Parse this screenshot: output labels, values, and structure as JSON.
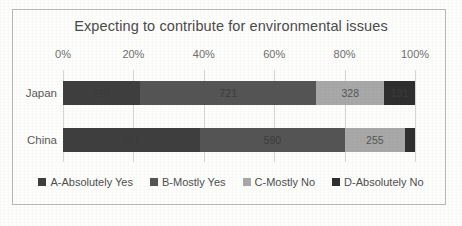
{
  "chart_data": {
    "type": "bar",
    "subtype": "stacked-horizontal-100pct",
    "title": "Expecting to contribute for environmental issues",
    "xlabel": "",
    "ylabel": "",
    "xlim": [
      0,
      100
    ],
    "grid": true,
    "legend_position": "bottom",
    "tick_labels": [
      "0%",
      "20%",
      "40%",
      "60%",
      "80%",
      "100%"
    ],
    "tick_values": [
      0,
      20,
      40,
      60,
      80,
      100
    ],
    "categories": [
      "Japan",
      "China"
    ],
    "series": [
      {
        "name": "A-Absolutely Yes",
        "color": "#3f3f3f",
        "values": [
          220,
          681
        ]
      },
      {
        "name": "B-Mostly Yes",
        "color": "#555555",
        "values": [
          721,
          590
        ]
      },
      {
        "name": "C-Mostly No",
        "color": "#a8a8a8",
        "values": [
          328,
          255
        ]
      },
      {
        "name": "D-Absolutely No",
        "color": "#2f2f2f",
        "values": [
          131,
          29
        ]
      }
    ],
    "bars": [
      {
        "category": "Japan",
        "total": 1400,
        "segments": [
          {
            "label": "220",
            "value": 220,
            "percent": 21.9,
            "start_percent": 0.0,
            "color": "#3f3f3f",
            "label_tone": "on-dark"
          },
          {
            "label": "721",
            "value": 721,
            "percent": 50.1,
            "start_percent": 21.9,
            "color": "#555555",
            "label_tone": "on-dark"
          },
          {
            "label": "328",
            "value": 328,
            "percent": 19.2,
            "start_percent": 72.0,
            "color": "#a8a8a8",
            "label_tone": "on-light"
          },
          {
            "label": "131",
            "value": 131,
            "percent": 8.8,
            "start_percent": 91.2,
            "color": "#2f2f2f",
            "label_tone": "on-dark"
          }
        ]
      },
      {
        "category": "China",
        "total": 1555,
        "segments": [
          {
            "label": "681",
            "value": 681,
            "percent": 38.9,
            "start_percent": 0.0,
            "color": "#3f3f3f",
            "label_tone": "on-dark"
          },
          {
            "label": "590",
            "value": 590,
            "percent": 41.2,
            "start_percent": 38.9,
            "color": "#555555",
            "label_tone": "on-dark"
          },
          {
            "label": "255",
            "value": 255,
            "percent": 17.0,
            "start_percent": 80.1,
            "color": "#a8a8a8",
            "label_tone": "on-light"
          },
          {
            "label": "",
            "value": 29,
            "percent": 2.9,
            "start_percent": 97.1,
            "color": "#2f2f2f",
            "label_tone": "on-dark"
          }
        ]
      }
    ]
  },
  "colors": {
    "series_a": "#3f3f3f",
    "series_b": "#555555",
    "series_c": "#a8a8a8",
    "series_d": "#2f2f2f",
    "gridline": "#d6d6d2",
    "border": "#b9b9b6",
    "text": "#4b4b4b"
  }
}
